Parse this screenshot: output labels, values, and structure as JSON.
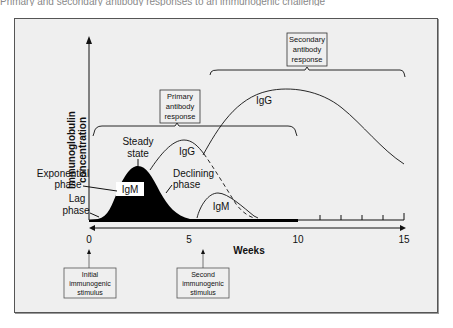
{
  "caption": "Primary and secondary antibody responses to an immunogenic challenge",
  "diagram": {
    "y_axis_label_line1": "Immunoglobulin",
    "y_axis_label_line2": "concentration",
    "x_axis_label": "Weeks",
    "x_ticks": [
      "0",
      "5",
      "10",
      "15"
    ],
    "callouts": {
      "primary_line1": "Primary",
      "primary_line2": "antibody",
      "primary_line3": "response",
      "secondary_line1": "Secondary",
      "secondary_line2": "antibody",
      "secondary_line3": "response",
      "initial_line1": "Initial",
      "initial_line2": "immunogenic",
      "initial_line3": "stimulus",
      "second_line1": "Second",
      "second_line2": "immunogenic",
      "second_line3": "stimulus"
    },
    "phase_labels": {
      "steady_line1": "Steady",
      "steady_line2": "state",
      "exponential_line1": "Exponential",
      "exponential_line2": "phase",
      "lag_line1": "Lag",
      "lag_line2": "phase",
      "declining_line1": "Declining",
      "declining_line2": "phase"
    },
    "curve_labels": {
      "primary_igm": "IgM",
      "primary_igg": "IgG",
      "secondary_igm": "IgM",
      "secondary_igg": "IgG"
    },
    "colors": {
      "background": "#efefef",
      "ink": "#111111",
      "igm_fill": "#000000"
    }
  }
}
